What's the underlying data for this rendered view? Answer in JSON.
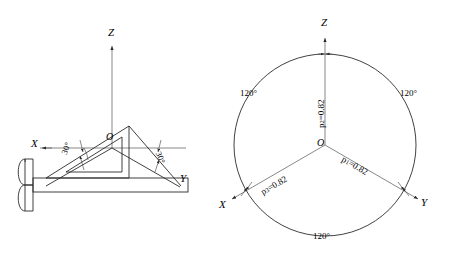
{
  "figure": {
    "background_color": "#ffffff",
    "line_color": "#2b2b2b",
    "width": 464,
    "height": 258
  },
  "left_diagram": {
    "name": "isometric-axes-with-tsquare-and-set-square",
    "axes": [
      {
        "id": "z",
        "label": "Z",
        "direction": "up"
      },
      {
        "id": "x",
        "label": "X",
        "direction": "left-down-30"
      },
      {
        "id": "y",
        "label": "Y",
        "direction": "right-down-30"
      }
    ],
    "origin_label": "O",
    "angles": [
      {
        "id": "left-angle",
        "label": "30°"
      },
      {
        "id": "right-angle",
        "label": "30°"
      }
    ],
    "instruments": [
      {
        "id": "t-square",
        "label": "t-square"
      },
      {
        "id": "set-square-30-60",
        "label": "set-square"
      }
    ]
  },
  "right_diagram": {
    "name": "isometric-axonometric-circle",
    "axes": [
      {
        "id": "z",
        "label": "Z",
        "direction": "up"
      },
      {
        "id": "x",
        "label": "X",
        "direction": "left-down-30"
      },
      {
        "id": "y",
        "label": "Y",
        "direction": "right-down-30"
      }
    ],
    "origin_label": "O",
    "angle_labels": [
      {
        "id": "angle-left",
        "label": "120°"
      },
      {
        "id": "angle-right",
        "label": "120°"
      },
      {
        "id": "angle-bottom",
        "label": "120°"
      }
    ],
    "coefficients": [
      {
        "id": "p1",
        "symbol": "p",
        "subscript": "1",
        "equals": "=",
        "value": "0.82",
        "axis": "y"
      },
      {
        "id": "p2",
        "symbol": "p",
        "subscript": "2",
        "equals": "=",
        "value": "0.82",
        "axis": "z"
      },
      {
        "id": "p3",
        "symbol": "p",
        "subscript": "3",
        "equals": "=",
        "value": "0.82",
        "axis": "x"
      }
    ]
  }
}
